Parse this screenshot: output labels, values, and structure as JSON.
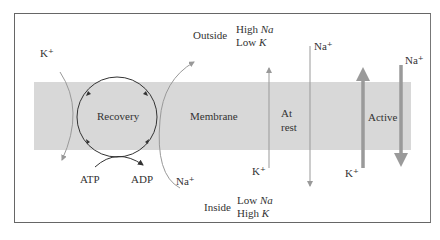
{
  "diagram": {
    "membrane_label": "Membrane",
    "outside": {
      "label": "Outside",
      "line1_prefix": "High ",
      "line1_ion": "Na",
      "line2_prefix": "Low ",
      "line2_ion": "K"
    },
    "inside": {
      "label": "Inside",
      "line1_prefix": "Low ",
      "line1_ion": "Na",
      "line2_prefix": "High ",
      "line2_ion": "K"
    },
    "recovery": {
      "label": "Recovery",
      "atp": "ATP",
      "adp": "ADP",
      "k_in": "K⁺",
      "na_out": "Na⁺"
    },
    "at_rest": {
      "line1": "At",
      "line2": "rest",
      "k_label": "K⁺",
      "na_label": "Na⁺"
    },
    "active": {
      "label": "Active",
      "k_label": "K⁺",
      "na_label": "Na⁺"
    },
    "colors": {
      "membrane": "#d8d8d8",
      "arrow_thin": "#999999",
      "arrow_thick": "#9a9a9a",
      "border": "#666666"
    }
  }
}
